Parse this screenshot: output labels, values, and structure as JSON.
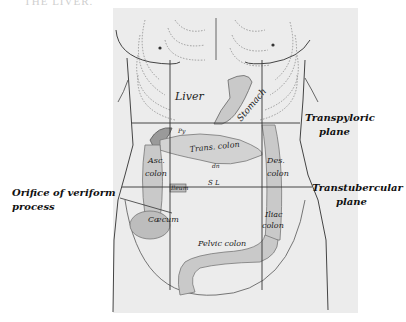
{
  "header": {
    "caption": "THE LIVER."
  },
  "annotations": {
    "transpyloric": {
      "line1": "Transpyloric",
      "line2": "plane"
    },
    "transtubercular": {
      "line1": "Transtubercular",
      "line2": "plane"
    },
    "orifice": {
      "line1": "Orifice of veriform",
      "line2": "process"
    }
  },
  "organ_labels": {
    "liver": "Liver",
    "stomach": "Stomach",
    "trans_colon": "Trans. colon",
    "asc_colon_1": "Asc.",
    "asc_colon_2": "colon",
    "des_colon_1": "Des.",
    "des_colon_2": "colon",
    "ileum": "Ileum",
    "caecum": "Cæcum",
    "iliac_colon_1": "Iliac",
    "iliac_colon_2": "colon",
    "pelvic_colon": "Pelvic colon",
    "sl": "S L",
    "dn": "dn",
    "py": "Py"
  },
  "colors": {
    "body_fill": "#ececec",
    "organ_fill": "#c9c9c9",
    "organ_dark": "#9a9a9a",
    "line": "#333333",
    "dotted": "#888888"
  }
}
